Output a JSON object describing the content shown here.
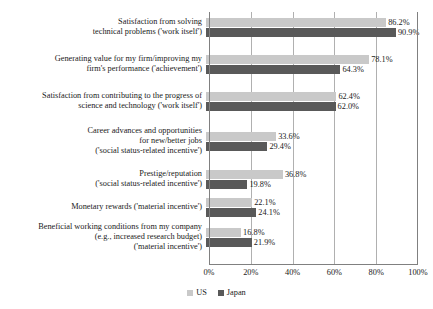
{
  "chart_data": {
    "type": "bar",
    "orientation": "horizontal",
    "title": "",
    "xlabel": "",
    "ylabel": "",
    "xlim": [
      0,
      100
    ],
    "xticks": [
      "0%",
      "20%",
      "40%",
      "60%",
      "80%",
      "100%"
    ],
    "xtick_values": [
      0,
      20,
      40,
      60,
      80,
      100
    ],
    "grid": true,
    "legend_position": "bottom-center",
    "categories": [
      "Satisfaction from solving\ntechnical problems ('work itself')",
      "Generating value for my firm/improving my\nfirm's performance ('achievement')",
      "Satisfaction from contributing to the progress of\nscience and technology ('work itself')",
      "Career advances and opportunities\nfor new/better jobs\n('social status-related incentive')",
      "Prestige/reputation\n('social status-related incentive')",
      "Monetary rewards ('material incentive')",
      "Beneficial working conditions from my company\n(e.g., increased research budget)\n('material incentive')"
    ],
    "series": [
      {
        "name": "US",
        "color": "#c9c9c9",
        "values": [
          86.2,
          78.1,
          62.4,
          33.6,
          36.8,
          22.1,
          16.8
        ],
        "labels": [
          "86.2%",
          "78.1%",
          "62.4%",
          "33.6%",
          "36.8%",
          "22.1%",
          "16.8%"
        ]
      },
      {
        "name": "Japan",
        "color": "#595959",
        "values": [
          90.9,
          64.3,
          62.0,
          29.4,
          19.8,
          24.1,
          21.9
        ],
        "labels": [
          "90.9%",
          "64.3%",
          "62.0%",
          "29.4%",
          "19.8%",
          "24.1%",
          "21.9%"
        ]
      }
    ]
  },
  "legend": {
    "items": [
      {
        "label": "US",
        "color": "#c9c9c9"
      },
      {
        "label": "Japan",
        "color": "#595959"
      }
    ]
  }
}
